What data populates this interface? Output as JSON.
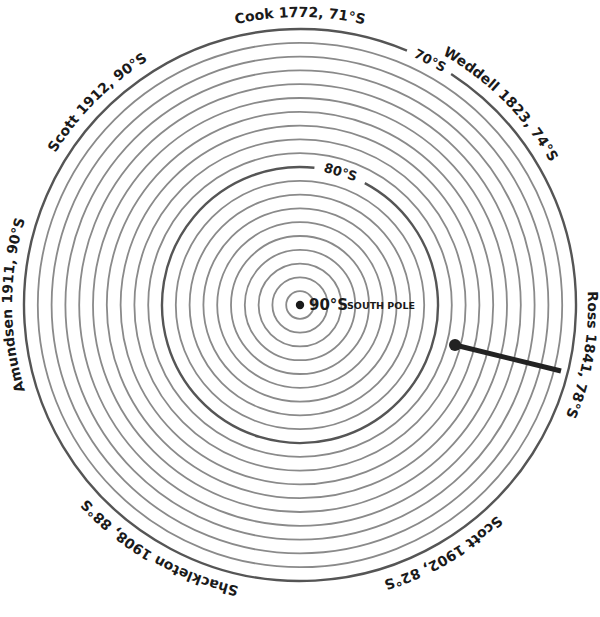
{
  "diagram": {
    "center": {
      "x": 300,
      "y": 305
    },
    "px_per_degree": 13.8,
    "rings": {
      "from_latitude": 70,
      "to_latitude": 89,
      "major": [
        70,
        80
      ],
      "color": "#8a8a8a",
      "major_color": "#555555"
    },
    "ring_labels": [
      {
        "latitude": 70,
        "text": "70°S",
        "angle_deg": 28
      },
      {
        "latitude": 80,
        "text": "80°S",
        "angle_deg": 17
      }
    ],
    "pole": {
      "latitude": 90,
      "label_main": "90°S",
      "label_sub": "SOUTH POLE"
    },
    "expeditions": [
      {
        "id": "cook",
        "text": "Cook 1772, 71°S",
        "angle_deg": 0
      },
      {
        "id": "weddell",
        "text": "Weddell 1823, 74°S",
        "angle_deg": 45
      },
      {
        "id": "ross",
        "text": "Ross 1841, 78°S",
        "angle_deg": 100
      },
      {
        "id": "scott-1902",
        "text": "Scott 1902, 82°S",
        "angle_deg": 150
      },
      {
        "id": "shackleton",
        "text": "Shackleton 1908, 88°S",
        "angle_deg": 210
      },
      {
        "id": "amundsen",
        "text": "Amundsen 1911, 90°S",
        "angle_deg": 270
      },
      {
        "id": "scott-1912",
        "text": "Scott 1912, 90°S",
        "angle_deg": 315
      }
    ],
    "ross_marker": {
      "start": {
        "x": 455,
        "y": 345
      },
      "end": {
        "x": 561,
        "y": 371
      },
      "color": "#222222"
    }
  }
}
